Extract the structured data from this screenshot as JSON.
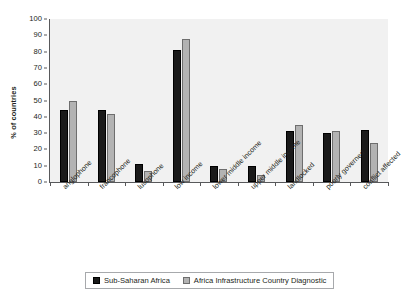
{
  "chart_data": {
    "type": "bar",
    "title": "",
    "xlabel": "",
    "ylabel": "% of countries",
    "ylim": [
      0,
      100
    ],
    "yticks": [
      0,
      10,
      20,
      30,
      40,
      50,
      60,
      70,
      80,
      90,
      100
    ],
    "grid": false,
    "legend_position": "bottom",
    "categories": [
      "anglophone",
      "francophone",
      "lusophone",
      "low income",
      "lower middle income",
      "upper middle income",
      "landlocked",
      "poorly governed",
      "conflict affected"
    ],
    "series": [
      {
        "name": "Sub-Saharan Africa",
        "color": "#1a1a1a",
        "values": [
          44,
          44,
          11,
          81,
          10,
          10,
          31,
          30,
          32
        ]
      },
      {
        "name": "Africa Infrastructure Country Diagnostic",
        "color": "#b3b3b3",
        "values": [
          50,
          42,
          7,
          88,
          8,
          4,
          35,
          31,
          24
        ]
      }
    ]
  },
  "legend": {
    "items": [
      {
        "label": "Sub-Saharan Africa"
      },
      {
        "label": "Africa Infrastructure Country Diagnostic"
      }
    ]
  },
  "colors": {
    "series_0": "#1a1a1a",
    "series_1": "#b3b3b3",
    "plot_background": "#f1f1f1",
    "axis": "#58595b",
    "text": "#231f20"
  }
}
